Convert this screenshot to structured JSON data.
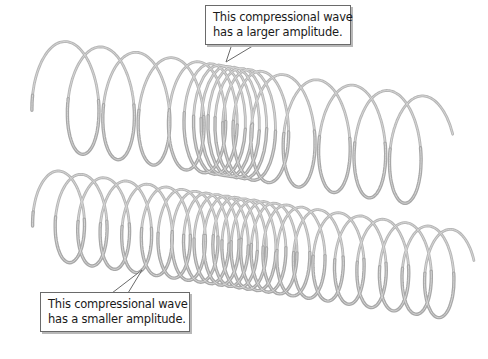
{
  "figure": {
    "colors": {
      "coil": "#a8a8a8",
      "coil_highlight": "#d6d6d6",
      "callout_border": "#6a6a6a",
      "text": "#1a1a1a",
      "background": "#ffffff"
    },
    "springs": [
      {
        "name": "top-spring",
        "description": "Spring with a strongly compressed region (larger amplitude)",
        "compression": "large"
      },
      {
        "name": "bottom-spring",
        "description": "Spring with a gently compressed region (smaller amplitude)",
        "compression": "small"
      }
    ],
    "callouts": {
      "top": {
        "line1": "This compressional wave",
        "line2": "has a larger amplitude."
      },
      "bottom": {
        "line1": "This compressional wave",
        "line2": "has a smaller amplitude."
      }
    }
  }
}
